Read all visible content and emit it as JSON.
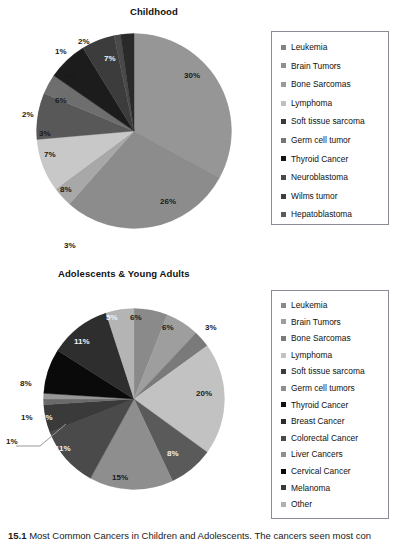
{
  "figure": {
    "caption_number": "15.1",
    "caption_text": "Most Common Cancers in Children and Adolescents. The cancers seen most con"
  },
  "chart_data": [
    {
      "type": "pie",
      "title": "Childhood",
      "legend_position": "right",
      "categories": [
        "Leukemia",
        "Brain Tumors",
        "Bone Sarcomas",
        "Lymphoma",
        "Soft tissue sarcoma",
        "Germ cell tumor",
        "Thyroid Cancer",
        "Neuroblastoma",
        "Wilms tumor",
        "Hepatoblastoma"
      ],
      "values": [
        30,
        26,
        3,
        8,
        7,
        3,
        6,
        5,
        1,
        2
      ],
      "labels": [
        "30%",
        "26%",
        "3%",
        "8%",
        "7%",
        "3%",
        "6%",
        "5%",
        "1%",
        "2%"
      ],
      "extra_labels": [
        "2%",
        "7%"
      ],
      "colors": [
        "#969696",
        "#8c8c8c",
        "#a8a8a8",
        "#c8c8c8",
        "#585858",
        "#6e6e6e",
        "#1c1c1c",
        "#3c3c3c",
        "#4a4a4a",
        "#2a2a2a"
      ],
      "swatch_colors": [
        "#858585",
        "#909090",
        "#9a9a9a",
        "#c0c0c0",
        "#3a3a3a",
        "#757575",
        "#141414",
        "#4a4a4a",
        "#3f3f3f",
        "#5a5a5a"
      ]
    },
    {
      "type": "pie",
      "title": "Adolescents & Young Adults",
      "legend_position": "right",
      "categories": [
        "Leukemia",
        "Brain Tumors",
        "Bone Sarcomas",
        "Lymphoma",
        "Soft tissue sarcoma",
        "Germ cell tumors",
        "Thyroid Cancer",
        "Breast Cancer",
        "Colorectal Cancer",
        "Liver Cancers",
        "Cervical Cancer",
        "Melanoma",
        "Other"
      ],
      "values": [
        6,
        6,
        3,
        20,
        8,
        15,
        11,
        5,
        1,
        1,
        8,
        11,
        5
      ],
      "labels": [
        "6%",
        "6%",
        "3%",
        "20%",
        "8%",
        "15%",
        "11%",
        "5%",
        "1%",
        "1%",
        "8%",
        "11%",
        "5%"
      ],
      "colors": [
        "#8a8a8a",
        "#9e9e9e",
        "#7a7a7a",
        "#c2c2c2",
        "#5a5a5a",
        "#8e8e8e",
        "#4a4a4a",
        "#3a3a3a",
        "#6a6a6a",
        "#989898",
        "#0a0a0a",
        "#2e2e2e",
        "#b4b4b4"
      ],
      "swatch_colors": [
        "#8a8a8a",
        "#9e9e9e",
        "#7a7a7a",
        "#c2c2c2",
        "#3c3c3c",
        "#8e8e8e",
        "#111111",
        "#2c2c2c",
        "#4a4a4a",
        "#8f8f8f",
        "#0a0a0a",
        "#3a3a3a",
        "#b0b0b0"
      ]
    }
  ]
}
